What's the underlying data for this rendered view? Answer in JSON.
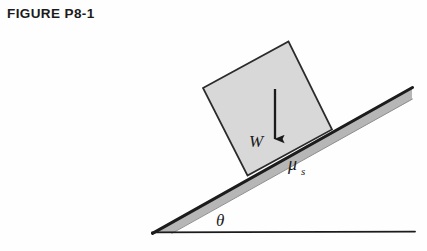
{
  "figure": {
    "title": "FIGURE P8-1",
    "caption_prefix": "FIGURE",
    "number": "P8-1"
  },
  "diagram": {
    "type": "free-body-inclined-plane",
    "labels": {
      "weight": "W",
      "angle": "θ",
      "friction_coefficient": "μ",
      "friction_subscript": "s"
    },
    "colors": {
      "background": "#fefefe",
      "block_fill": "#d9d9d9",
      "block_stroke": "#2b2b2b",
      "incline_fill": "#b5b5b5",
      "incline_stroke": "#1c1c1c",
      "baseline_stroke": "#1c1c1c",
      "arrow_color": "#1a1a1a",
      "title_color": "#1b1b1b"
    },
    "geometry": {
      "incline_angle_deg": 29,
      "incline_apex": [
        153,
        233
      ],
      "incline_top_right": [
        412,
        88
      ],
      "baseline_right": [
        415,
        232
      ],
      "block_corners": "203,88 288,42 332,130 248,175",
      "weight_arrow_from": [
        275,
        89
      ],
      "weight_arrow_to": [
        275,
        147
      ]
    }
  }
}
